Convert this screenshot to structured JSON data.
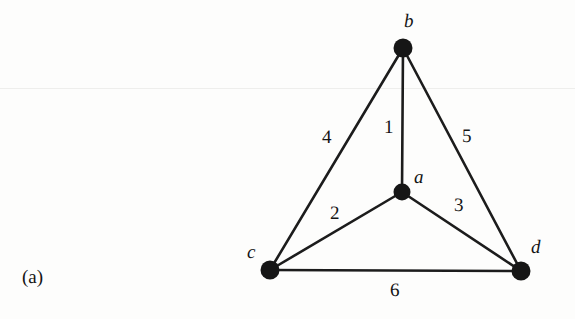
{
  "figure": {
    "caption": "(a)",
    "background_color": "#fdfdfc",
    "ink_color": "#161616",
    "scan_line_y": 88,
    "scan_line_color": "#eeeeec",
    "width": 575,
    "height": 319
  },
  "graph": {
    "type": "undirected-weighted-graph",
    "node_radius": 9,
    "nodes": [
      {
        "id": "a",
        "label": "a",
        "x": 402,
        "y": 192,
        "r": 8.5,
        "label_x": 414,
        "label_y": 168
      },
      {
        "id": "b",
        "label": "b",
        "x": 403,
        "y": 48,
        "r": 9.5,
        "label_x": 404,
        "label_y": 12
      },
      {
        "id": "c",
        "label": "c",
        "x": 270,
        "y": 270,
        "r": 9.5,
        "label_x": 247,
        "label_y": 243
      },
      {
        "id": "d",
        "label": "d",
        "x": 521,
        "y": 271,
        "r": 9.5,
        "label_x": 531,
        "label_y": 238
      }
    ],
    "edges": [
      {
        "id": "e1",
        "label": "1",
        "from": "b",
        "to": "a",
        "label_x": 384,
        "label_y": 118
      },
      {
        "id": "e2",
        "label": "2",
        "from": "a",
        "to": "c",
        "label_x": 330,
        "label_y": 204
      },
      {
        "id": "e3",
        "label": "3",
        "from": "a",
        "to": "d",
        "label_x": 454,
        "label_y": 196
      },
      {
        "id": "e4",
        "label": "4",
        "from": "b",
        "to": "c",
        "label_x": 322,
        "label_y": 128
      },
      {
        "id": "e5",
        "label": "5",
        "from": "b",
        "to": "d",
        "label_x": 462,
        "label_y": 127
      },
      {
        "id": "e6",
        "label": "6",
        "from": "c",
        "to": "d",
        "label_x": 390,
        "label_y": 281
      }
    ]
  }
}
